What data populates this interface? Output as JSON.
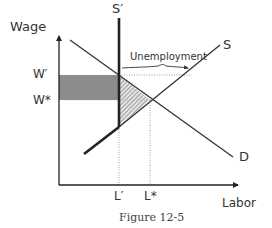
{
  "figure": {
    "caption": "Figure 12-5",
    "axes": {
      "y_label": "Wage",
      "x_label": "Labor"
    },
    "curves": {
      "supply": "S",
      "supply_minimum": "S′",
      "demand": "D"
    },
    "y_ticks": {
      "w_prime": "W′",
      "w_star": "W*"
    },
    "x_ticks": {
      "l_prime": "L′",
      "l_star": "L*"
    },
    "annotation": "Unemployment",
    "colors": {
      "line": "#333333",
      "thick_line": "#222222",
      "gray_area": "#8c8c8c",
      "hatch": "#666666",
      "dotted": "#888888"
    }
  }
}
